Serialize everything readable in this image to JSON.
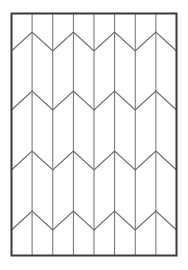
{
  "figure": {
    "background_color": "#ffffff"
  },
  "canvas": {
    "width": 188,
    "height": 270
  },
  "panel": {
    "name": "panel-border",
    "x": 11.5,
    "y": 13.5,
    "width": 165,
    "height": 242,
    "stroke_color": "#3a3a3a",
    "stroke_width": 2,
    "fill": "none"
  },
  "columns": {
    "count": 8,
    "divider_count": 7,
    "stroke_color": "#6e6e6e",
    "stroke_width": 1,
    "x_positions": [
      32.1,
      52.75,
      73.4,
      94.0,
      114.6,
      135.25,
      155.9
    ]
  },
  "chevrons": {
    "row_count": 4,
    "stroke_color": "#6e6e6e",
    "stroke_width": 1.2,
    "peak_offsets": [
      32,
      91,
      151,
      211
    ],
    "valley_offsets": [
      51,
      110,
      170,
      230
    ],
    "peak_x_positions": [
      32.1,
      73.4,
      114.6,
      155.9
    ],
    "valley_x_positions": [
      11.5,
      52.75,
      94.0,
      135.25,
      176.5
    ],
    "rows": [
      {
        "name": "chevron-row-1",
        "peak_y": 32,
        "valley_y": 51
      },
      {
        "name": "chevron-row-2",
        "peak_y": 91,
        "valley_y": 110
      },
      {
        "name": "chevron-row-3",
        "peak_y": 151,
        "valley_y": 170
      },
      {
        "name": "chevron-row-4",
        "peak_y": 211,
        "valley_y": 230
      }
    ]
  },
  "chart_data": {
    "type": "line",
    "xlabel": "",
    "ylabel": "",
    "xlim": [
      11.5,
      176.5
    ],
    "ylim": [
      13.5,
      255.5
    ],
    "grid": false,
    "legend": "none",
    "series": [
      {
        "name": "chevron-row-1",
        "x": [
          11.5,
          32.1,
          52.75,
          73.4,
          94.0,
          114.6,
          135.25,
          155.9,
          176.5
        ],
        "values": [
          51,
          32,
          51,
          32,
          51,
          32,
          51,
          32,
          51
        ]
      },
      {
        "name": "chevron-row-2",
        "x": [
          11.5,
          32.1,
          52.75,
          73.4,
          94.0,
          114.6,
          135.25,
          155.9,
          176.5
        ],
        "values": [
          110,
          91,
          110,
          91,
          110,
          91,
          110,
          91,
          110
        ]
      },
      {
        "name": "chevron-row-3",
        "x": [
          11.5,
          32.1,
          52.75,
          73.4,
          94.0,
          114.6,
          135.25,
          155.9,
          176.5
        ],
        "values": [
          170,
          151,
          170,
          151,
          170,
          151,
          170,
          151,
          170
        ]
      },
      {
        "name": "chevron-row-4",
        "x": [
          11.5,
          32.1,
          52.75,
          73.4,
          94.0,
          114.6,
          135.25,
          155.9,
          176.5
        ],
        "values": [
          230,
          211,
          230,
          211,
          230,
          211,
          230,
          211,
          230
        ]
      }
    ]
  }
}
